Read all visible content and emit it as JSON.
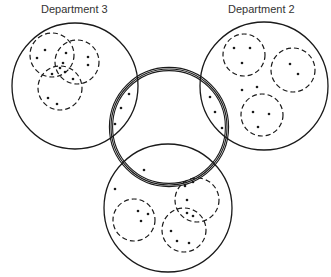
{
  "labels": {
    "dept3": "Department 3",
    "dept2": "Department 2"
  },
  "departments": [
    {
      "name": "Department 3",
      "cx": 75,
      "cy": 86,
      "r": 63,
      "groups": [
        {
          "cx": 52,
          "cy": 55,
          "r": 22
        },
        {
          "cx": 77,
          "cy": 62,
          "r": 22
        },
        {
          "cx": 60,
          "cy": 88,
          "r": 22
        }
      ]
    },
    {
      "name": "Department 2",
      "cx": 264,
      "cy": 86,
      "r": 64,
      "groups": [
        {
          "cx": 244,
          "cy": 55,
          "r": 21
        },
        {
          "cx": 293,
          "cy": 70,
          "r": 22
        },
        {
          "cx": 262,
          "cy": 115,
          "r": 21
        }
      ]
    },
    {
      "name": "Department 1",
      "cx": 168,
      "cy": 208,
      "r": 64,
      "groups": [
        {
          "cx": 134,
          "cy": 220,
          "r": 21
        },
        {
          "cx": 197,
          "cy": 200,
          "r": 22
        },
        {
          "cx": 184,
          "cy": 230,
          "r": 22
        }
      ]
    }
  ],
  "center_circle": {
    "cx": 169,
    "cy": 127,
    "r": 58
  },
  "dots": [
    [
      45,
      50
    ],
    [
      37,
      58
    ],
    [
      66,
      53
    ],
    [
      63,
      63
    ],
    [
      88,
      57
    ],
    [
      88,
      65
    ],
    [
      52,
      74
    ],
    [
      60,
      68
    ],
    [
      65,
      72
    ],
    [
      73,
      79
    ],
    [
      48,
      98
    ],
    [
      57,
      104
    ],
    [
      234,
      48
    ],
    [
      250,
      48
    ],
    [
      242,
      63
    ],
    [
      290,
      64
    ],
    [
      298,
      74
    ],
    [
      242,
      90
    ],
    [
      257,
      87
    ],
    [
      253,
      112
    ],
    [
      269,
      114
    ],
    [
      258,
      127
    ],
    [
      129,
      94
    ],
    [
      121,
      108
    ],
    [
      115,
      124
    ],
    [
      210,
      97
    ],
    [
      215,
      112
    ],
    [
      222,
      128
    ],
    [
      144,
      170
    ],
    [
      115,
      189
    ],
    [
      138,
      211
    ],
    [
      148,
      214
    ],
    [
      141,
      221
    ],
    [
      185,
      186
    ],
    [
      193,
      182
    ],
    [
      187,
      200
    ],
    [
      187,
      213
    ],
    [
      193,
      216
    ],
    [
      171,
      231
    ],
    [
      177,
      241
    ],
    [
      189,
      243
    ]
  ]
}
